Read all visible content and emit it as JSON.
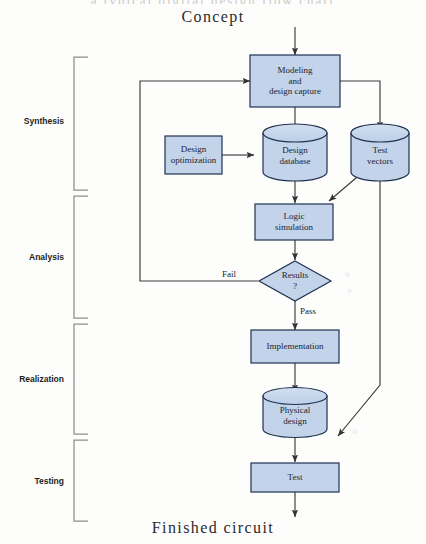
{
  "diagram": {
    "title_bleed": "a typical digital design flow chart",
    "start_label": "Concept",
    "end_label": "Finished circuit",
    "fill_color": "#c3d3e9",
    "stroke_color": "#1f3350",
    "line_color": "#4a4a4a",
    "phases": [
      {
        "name": "Synthesis",
        "label": "Synthesis"
      },
      {
        "name": "Analysis",
        "label": "Analysis"
      },
      {
        "name": "Realization",
        "label": "Realization"
      },
      {
        "name": "Testing",
        "label": "Testing"
      }
    ],
    "nodes": [
      {
        "id": "modeling",
        "shape": "process",
        "label": "Modeling\nand\ndesign capture"
      },
      {
        "id": "design_opt",
        "shape": "process",
        "label": "Design\noptimization"
      },
      {
        "id": "design_db",
        "shape": "cylinder",
        "label": "Design\ndatabase"
      },
      {
        "id": "test_vectors",
        "shape": "cylinder",
        "label": "Test\nvectors"
      },
      {
        "id": "logic_sim",
        "shape": "process",
        "label": "Logic\nsimulation"
      },
      {
        "id": "results",
        "shape": "decision",
        "label": "Results\n?"
      },
      {
        "id": "implementation",
        "shape": "process",
        "label": "Implementation"
      },
      {
        "id": "physical",
        "shape": "cylinder",
        "label": "Physical\ndesign"
      },
      {
        "id": "test",
        "shape": "process",
        "label": "Test"
      }
    ],
    "edge_labels": [
      {
        "id": "fail",
        "label": "Fail"
      },
      {
        "id": "pass",
        "label": "Pass"
      }
    ]
  }
}
